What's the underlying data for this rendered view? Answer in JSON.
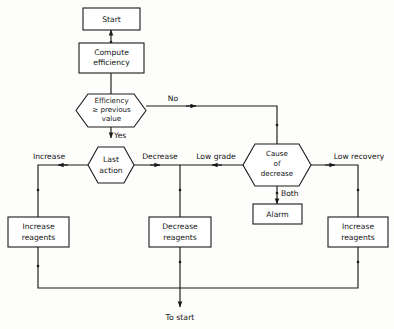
{
  "diagram": {
    "stroke_color": "#1a1a1a",
    "fill_color": "#ffffff",
    "background_color": "#fdfdfb"
  },
  "nodes": {
    "start": {
      "label": "Start",
      "shape": "rectangle"
    },
    "compute": {
      "line1": "Compute",
      "line2": "efficiency",
      "shape": "rectangle"
    },
    "efficiency_check": {
      "line1": "Efficiency",
      "line2": "≥  previous",
      "line3": "value",
      "shape": "hexagon"
    },
    "last_action": {
      "line1": "Last",
      "line2": "action",
      "shape": "hexagon"
    },
    "cause_of_decrease": {
      "line1": "Cause",
      "line2": "of",
      "line3": "decrease",
      "shape": "hexagon"
    },
    "alarm": {
      "label": "Alarm",
      "shape": "rectangle"
    },
    "increase_left": {
      "line1": "Increase",
      "line2": "reagents",
      "shape": "rectangle"
    },
    "decrease_mid": {
      "line1": "Decrease",
      "line2": "reagents",
      "shape": "rectangle"
    },
    "increase_right": {
      "line1": "Increase",
      "line2": "reagents",
      "shape": "rectangle"
    }
  },
  "edge_labels": {
    "no": "No",
    "yes": "Yes",
    "increase": "Increase",
    "decrease": "Decrease",
    "low_grade": "Low grade",
    "low_recovery": "Low recovery",
    "both": "Both"
  },
  "terminal": {
    "to_start": "To start"
  }
}
